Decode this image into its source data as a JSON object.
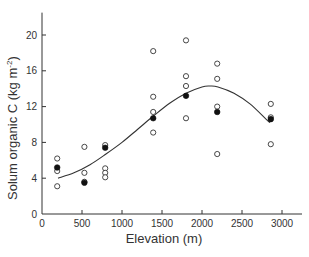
{
  "chart_data": {
    "type": "scatter",
    "title": "",
    "xlabel": "Elevation (m)",
    "ylabel": "Solum organic C (kg m⁻²)",
    "ylabel_parts": {
      "main": "Solum organic C (kg m",
      "sup": "-2",
      "close": ")"
    },
    "xlim": [
      0,
      3250
    ],
    "ylim": [
      0,
      22.5
    ],
    "xticks": [
      0,
      500,
      1000,
      1500,
      2000,
      2500,
      3000
    ],
    "yticks": [
      0,
      4,
      8,
      12,
      16,
      20
    ],
    "grid": false,
    "legend": null,
    "series": [
      {
        "name": "Individual pedons",
        "marker": "open-circle",
        "points": [
          {
            "x": 190,
            "y": 6.2
          },
          {
            "x": 190,
            "y": 4.8
          },
          {
            "x": 190,
            "y": 3.1
          },
          {
            "x": 530,
            "y": 7.5
          },
          {
            "x": 530,
            "y": 4.6
          },
          {
            "x": 530,
            "y": 3.6
          },
          {
            "x": 790,
            "y": 7.7
          },
          {
            "x": 790,
            "y": 5.1
          },
          {
            "x": 790,
            "y": 4.6
          },
          {
            "x": 790,
            "y": 4.1
          },
          {
            "x": 1390,
            "y": 18.2
          },
          {
            "x": 1390,
            "y": 13.1
          },
          {
            "x": 1390,
            "y": 11.4
          },
          {
            "x": 1390,
            "y": 9.1
          },
          {
            "x": 1800,
            "y": 19.4
          },
          {
            "x": 1800,
            "y": 15.4
          },
          {
            "x": 1800,
            "y": 14.3
          },
          {
            "x": 1800,
            "y": 10.7
          },
          {
            "x": 2190,
            "y": 16.8
          },
          {
            "x": 2190,
            "y": 15.1
          },
          {
            "x": 2190,
            "y": 12.0
          },
          {
            "x": 2190,
            "y": 6.7
          },
          {
            "x": 2860,
            "y": 12.3
          },
          {
            "x": 2860,
            "y": 10.8
          },
          {
            "x": 2860,
            "y": 7.8
          }
        ]
      },
      {
        "name": "Site means",
        "marker": "filled-circle",
        "points": [
          {
            "x": 190,
            "y": 5.2
          },
          {
            "x": 530,
            "y": 3.5
          },
          {
            "x": 790,
            "y": 7.4
          },
          {
            "x": 1390,
            "y": 10.7
          },
          {
            "x": 1800,
            "y": 13.2
          },
          {
            "x": 2190,
            "y": 11.4
          },
          {
            "x": 2860,
            "y": 10.6
          }
        ]
      },
      {
        "name": "Fitted curve",
        "marker": "line",
        "points": [
          {
            "x": 200,
            "y": 4.0
          },
          {
            "x": 400,
            "y": 4.6
          },
          {
            "x": 600,
            "y": 5.5
          },
          {
            "x": 800,
            "y": 6.7
          },
          {
            "x": 1000,
            "y": 8.0
          },
          {
            "x": 1200,
            "y": 9.5
          },
          {
            "x": 1400,
            "y": 11.0
          },
          {
            "x": 1600,
            "y": 12.4
          },
          {
            "x": 1800,
            "y": 13.5
          },
          {
            "x": 2000,
            "y": 14.2
          },
          {
            "x": 2100,
            "y": 14.3
          },
          {
            "x": 2200,
            "y": 14.2
          },
          {
            "x": 2400,
            "y": 13.5
          },
          {
            "x": 2600,
            "y": 12.3
          },
          {
            "x": 2800,
            "y": 10.6
          },
          {
            "x": 2850,
            "y": 10.2
          }
        ]
      }
    ]
  }
}
